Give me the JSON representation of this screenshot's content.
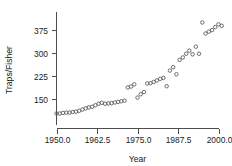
{
  "chart_data": {
    "type": "scatter",
    "title": "",
    "xlabel": "Year",
    "ylabel": "Traps/Fisher",
    "xlim": [
      1948.5,
      2002.5
    ],
    "ylim": [
      88,
      410
    ],
    "xticks": [
      1950.0,
      1962.5,
      1975.0,
      1987.5,
      2000.0
    ],
    "xticklabels": [
      "1950.0",
      "1962.5",
      "1975.0",
      "1987.5",
      "2000.0"
    ],
    "yticks": [
      150,
      225,
      300,
      375
    ],
    "yticklabels": [
      "150",
      "225",
      "300",
      "375"
    ],
    "grid": false,
    "legend": null,
    "marker": "open-circle",
    "marker_color": "#55555c",
    "series": [
      {
        "name": "Traps per Fisher",
        "x": [
          1950,
          1951,
          1952,
          1953,
          1954,
          1955,
          1956,
          1957,
          1958,
          1959,
          1960,
          1961,
          1962,
          1963,
          1964,
          1965,
          1966,
          1967,
          1968,
          1969,
          1970,
          1971,
          1972,
          1973,
          1974,
          1975,
          1976,
          1977,
          1978,
          1979,
          1980,
          1981,
          1982,
          1983,
          1984,
          1985,
          1986,
          1987,
          1988,
          1989,
          1990,
          1991,
          1992,
          1993,
          1994,
          1995,
          1996,
          1997,
          1998,
          1999,
          2000,
          2001
        ],
        "y": [
          101,
          101,
          103,
          104,
          104,
          106,
          107,
          110,
          114,
          118,
          121,
          123,
          128,
          133,
          136,
          133,
          134,
          135,
          137,
          139,
          141,
          143,
          186,
          189,
          196,
          153,
          164,
          171,
          199,
          200,
          204,
          209,
          214,
          217,
          190,
          241,
          252,
          229,
          276,
          284,
          296,
          306,
          294,
          319,
          296,
          398,
          362,
          368,
          373,
          383,
          392,
          387
        ]
      }
    ]
  },
  "axis_style": {
    "axis_color": "#4d4d4d",
    "text_color": "#1a1a1a",
    "background": "#ffffff"
  }
}
